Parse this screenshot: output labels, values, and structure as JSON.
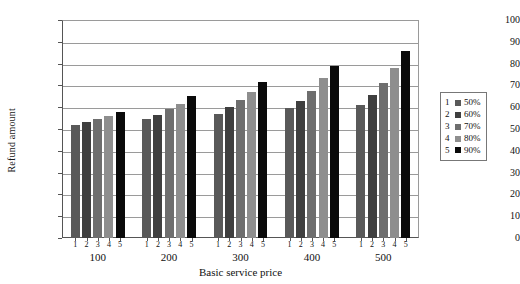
{
  "chart_data": {
    "type": "bar",
    "title": "",
    "xlabel": "Basic service price",
    "ylabel": "Refund amount",
    "categories": [
      "100",
      "200",
      "300",
      "400",
      "500"
    ],
    "ylim": [
      0,
      100
    ],
    "yticks": [
      0,
      10,
      20,
      30,
      40,
      50,
      60,
      70,
      80,
      90,
      100
    ],
    "grid": true,
    "legend_position": "right",
    "series": [
      {
        "name": "1",
        "label": "50%",
        "color": "#595959",
        "values": [
          52,
          54.5,
          57,
          59.5,
          61
        ]
      },
      {
        "name": "2",
        "label": "60%",
        "color": "#3f3f3f",
        "values": [
          53,
          56.5,
          60,
          63,
          65.5
        ]
      },
      {
        "name": "3",
        "label": "70%",
        "color": "#6e6e6e",
        "values": [
          54.5,
          59,
          63.5,
          67.5,
          71
        ]
      },
      {
        "name": "4",
        "label": "80%",
        "color": "#8e8e8e",
        "values": [
          56,
          61.5,
          67,
          73.5,
          78
        ]
      },
      {
        "name": "5",
        "label": "90%",
        "color": "#0a0a0a",
        "values": [
          58,
          65,
          71.5,
          79,
          86
        ]
      }
    ],
    "bar_sub_labels": [
      "1",
      "2",
      "3",
      "4",
      "5"
    ]
  },
  "legend": {
    "entries": [
      {
        "key": "1",
        "value": "50%",
        "color": "#595959"
      },
      {
        "key": "2",
        "value": "60%",
        "color": "#3f3f3f"
      },
      {
        "key": "3",
        "value": "70%",
        "color": "#6e6e6e"
      },
      {
        "key": "4",
        "value": "80%",
        "color": "#8e8e8e"
      },
      {
        "key": "5",
        "value": "90%",
        "color": "#0a0a0a"
      }
    ]
  }
}
